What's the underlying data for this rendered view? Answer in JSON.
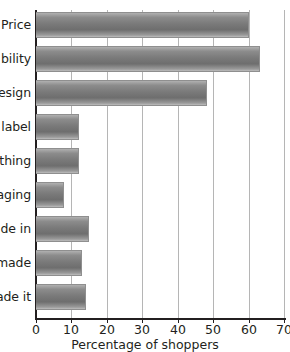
{
  "chart_data": {
    "type": "bar",
    "orientation": "horizontal",
    "title": "",
    "xlabel": "Percentage of shoppers",
    "ylabel": "",
    "xlim": [
      0,
      70
    ],
    "xticks": [
      0,
      10,
      20,
      30,
      40,
      50,
      60,
      70
    ],
    "grid": "vertical",
    "legend": "none",
    "categories": [
      "Price",
      "bility",
      "esign",
      "label",
      "thing",
      "aging",
      "de in",
      "made",
      "ade it"
    ],
    "values": [
      60,
      63,
      48,
      12,
      12,
      8,
      15,
      13,
      14
    ],
    "bar_color": "#7a7a7a",
    "axis_color": "#231f20",
    "grid_color": "#b5b5b5",
    "note": "Category labels are clipped by the left edge of the screenshot; only the trailing characters are visible."
  }
}
